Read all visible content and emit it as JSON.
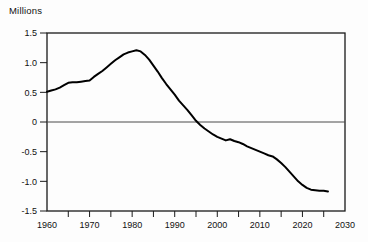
{
  "chart_data": {
    "type": "line",
    "title": "",
    "xlabel": "",
    "ylabel": "Millions",
    "x_range": [
      1960,
      2030
    ],
    "y_range": [
      -1.5,
      1.5
    ],
    "grid": false,
    "legend": "none",
    "zero_line": true,
    "x_major_ticks": [
      "1960",
      "1970",
      "1980",
      "1990",
      "2000",
      "2010",
      "2020",
      "2030"
    ],
    "x_major_tick_values": [
      1960,
      1970,
      1980,
      1990,
      2000,
      2010,
      2020,
      2030
    ],
    "x_minor_tick_step": 5,
    "y_ticks": [
      {
        "v": 1.5,
        "label": "1.5"
      },
      {
        "v": 1.0,
        "label": "1.0"
      },
      {
        "v": 0.5,
        "label": "0.5"
      },
      {
        "v": 0.0,
        "label": "0"
      },
      {
        "v": -0.5,
        "label": "-0.5"
      },
      {
        "v": -1.0,
        "label": "-1.0"
      },
      {
        "v": -1.5,
        "label": "-1.5"
      }
    ],
    "line_color": "#000000",
    "axis_color": "#1a1a1a",
    "zero_line_color": "#4a4a4a",
    "background": "#fdfdfd",
    "series": {
      "x": [
        1960,
        1961,
        1962,
        1963,
        1964,
        1965,
        1966,
        1967,
        1968,
        1969,
        1970,
        1971,
        1972,
        1973,
        1974,
        1975,
        1976,
        1977,
        1978,
        1979,
        1980,
        1981,
        1982,
        1983,
        1984,
        1985,
        1986,
        1987,
        1988,
        1989,
        1990,
        1991,
        1992,
        1993,
        1994,
        1995,
        1996,
        1997,
        1998,
        1999,
        2000,
        2001,
        2002,
        2003,
        2004,
        2005,
        2006,
        2007,
        2008,
        2009,
        2010,
        2011,
        2012,
        2013,
        2014,
        2015,
        2016,
        2017,
        2018,
        2019,
        2020,
        2021,
        2022,
        2023,
        2024,
        2025,
        2026
      ],
      "y": [
        0.51,
        0.53,
        0.55,
        0.58,
        0.62,
        0.66,
        0.67,
        0.67,
        0.68,
        0.69,
        0.7,
        0.76,
        0.81,
        0.86,
        0.92,
        0.98,
        1.04,
        1.09,
        1.14,
        1.17,
        1.19,
        1.21,
        1.19,
        1.13,
        1.05,
        0.95,
        0.85,
        0.74,
        0.64,
        0.55,
        0.46,
        0.36,
        0.28,
        0.2,
        0.11,
        0.02,
        -0.05,
        -0.11,
        -0.16,
        -0.21,
        -0.25,
        -0.28,
        -0.31,
        -0.29,
        -0.32,
        -0.34,
        -0.37,
        -0.41,
        -0.44,
        -0.47,
        -0.5,
        -0.53,
        -0.56,
        -0.58,
        -0.63,
        -0.69,
        -0.76,
        -0.84,
        -0.92,
        -1.0,
        -1.06,
        -1.11,
        -1.14,
        -1.15,
        -1.16,
        -1.16,
        -1.17
      ]
    }
  }
}
